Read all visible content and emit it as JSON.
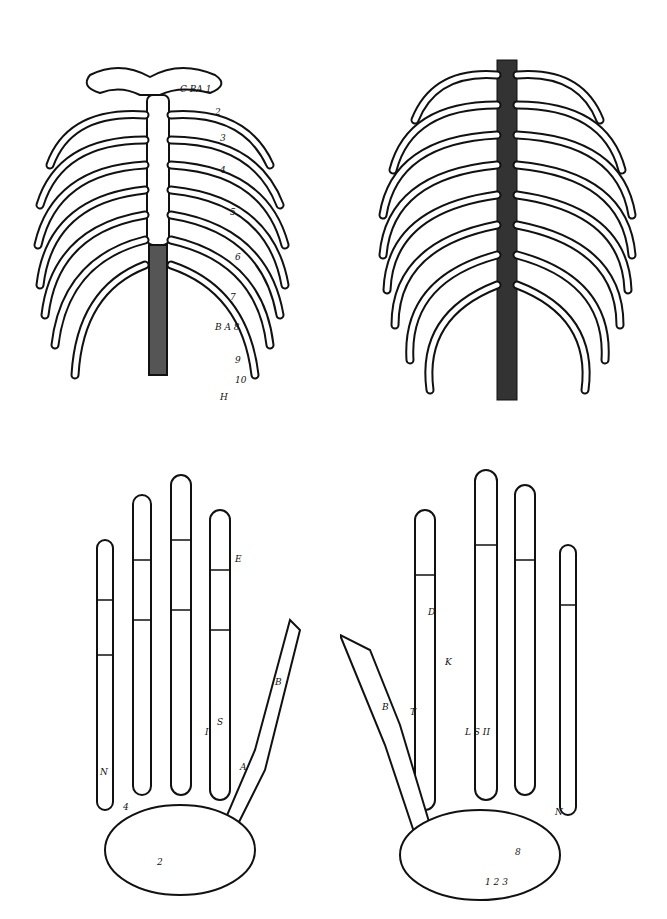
{
  "figures": [
    {
      "name": "thorax-anterior",
      "description": "Rib cage, front view, with sternum and clavicles",
      "labels": [
        "C",
        "B",
        "A",
        "1",
        "2",
        "3",
        "4",
        "5",
        "6",
        "7",
        "B",
        "A",
        "8",
        "9",
        "10",
        "11",
        "12",
        "H"
      ]
    },
    {
      "name": "thorax-posterior",
      "description": "Rib cage, back view, with thoracic spine",
      "labels": [
        "1",
        "2",
        "3",
        "4",
        "5",
        "6",
        "7",
        "8",
        "9",
        "10",
        "11"
      ]
    },
    {
      "name": "hand-dorsal",
      "description": "Skeleton of the left hand, dorsal view",
      "labels": [
        "E",
        "C",
        "B",
        "T",
        "A",
        "S",
        "I",
        "II",
        "III",
        "IIII",
        "N",
        "4",
        "2",
        "1",
        "6",
        "7"
      ]
    },
    {
      "name": "hand-palmar",
      "description": "Skeleton of the right hand, palmar view",
      "labels": [
        "E",
        "D",
        "K",
        "B",
        "T",
        "L",
        "S",
        "II",
        "III",
        "IIII",
        "N",
        "6",
        "7",
        "8",
        "1",
        "2",
        "3"
      ]
    }
  ],
  "colors": {
    "ink": "#111111",
    "paper": "#ffffff"
  }
}
